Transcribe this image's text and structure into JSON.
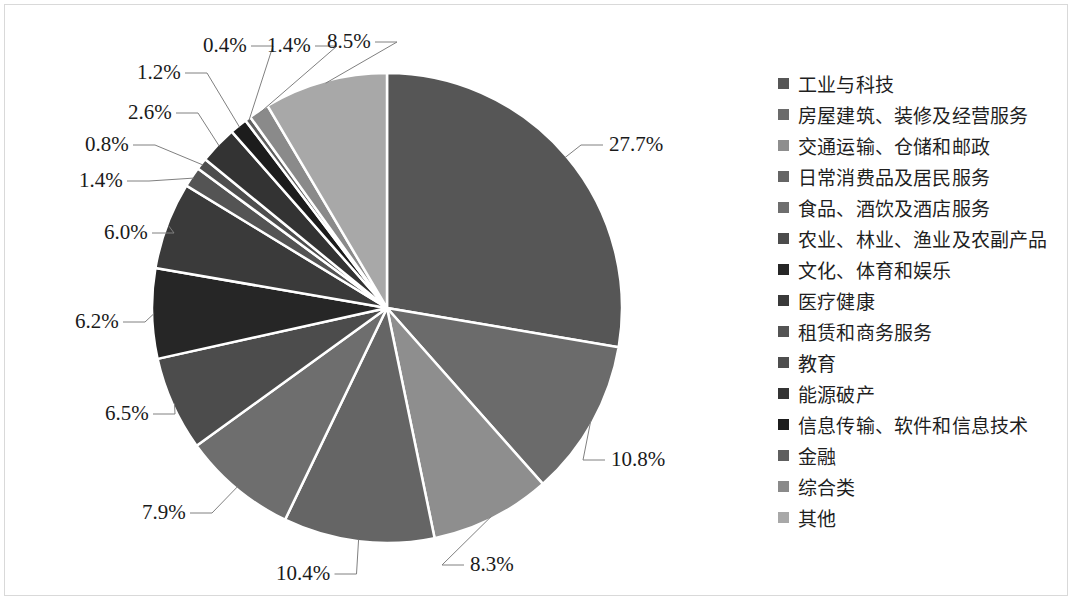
{
  "chart_data": {
    "type": "pie",
    "title": "",
    "legend_position": "right",
    "categories": [
      "工业与科技",
      "房屋建筑、装修及经营服务",
      "交通运输、仓储和邮政",
      "日常消费品及居民服务",
      "食品、酒饮及酒店服务",
      "农业、林业、渔业及农副产品",
      "文化、体育和娱乐",
      "医疗健康",
      "租赁和商务服务",
      "教育",
      "能源破产",
      "信息传输、软件和信息技术",
      "金融",
      "综合类",
      "其他"
    ],
    "values": [
      27.7,
      10.8,
      8.3,
      10.4,
      7.9,
      6.5,
      6.2,
      6.0,
      1.4,
      0.8,
      2.6,
      1.2,
      0.4,
      1.4,
      8.5
    ],
    "value_labels": [
      "27.7%",
      "10.8%",
      "8.3%",
      "10.4%",
      "7.9%",
      "6.5%",
      "6.2%",
      "6.0%",
      "1.4%",
      "0.8%",
      "2.6%",
      "1.2%",
      "0.4%",
      "1.4%",
      "8.5%"
    ],
    "unit": "%",
    "colors": [
      "#565656",
      "#6b6b6b",
      "#8e8e8e",
      "#656565",
      "#6e6e6e",
      "#4c4c4c",
      "#262626",
      "#3a3a3a",
      "#545454",
      "#4e4e4e",
      "#333333",
      "#1c1c1c",
      "#5f5f5f",
      "#8a8a8a",
      "#a8a8a8"
    ],
    "slice_border_color": "#ffffff",
    "leader_line_color": "#808080"
  },
  "legend": {
    "items": [
      {
        "label": "工业与科技",
        "color": "#565656"
      },
      {
        "label": "房屋建筑、装修及经营服务",
        "color": "#6b6b6b"
      },
      {
        "label": "交通运输、仓储和邮政",
        "color": "#8e8e8e"
      },
      {
        "label": "日常消费品及居民服务",
        "color": "#656565"
      },
      {
        "label": "食品、酒饮及酒店服务",
        "color": "#6e6e6e"
      },
      {
        "label": "农业、林业、渔业及农副产品",
        "color": "#4c4c4c"
      },
      {
        "label": "文化、体育和娱乐",
        "color": "#262626"
      },
      {
        "label": "医疗健康",
        "color": "#3a3a3a"
      },
      {
        "label": "租赁和商务服务",
        "color": "#545454"
      },
      {
        "label": "教育",
        "color": "#4e4e4e"
      },
      {
        "label": "能源破产",
        "color": "#333333"
      },
      {
        "label": "信息传输、软件和信息技术",
        "color": "#1c1c1c"
      },
      {
        "label": "金融",
        "color": "#5f5f5f"
      },
      {
        "label": "综合类",
        "color": "#8a8a8a"
      },
      {
        "label": "其他",
        "color": "#a8a8a8"
      }
    ]
  },
  "pie_labels": [
    {
      "text": "27.7%",
      "x": 609,
      "y": 134
    },
    {
      "text": "10.8%",
      "x": 611,
      "y": 449
    },
    {
      "text": "8.3%",
      "x": 470,
      "y": 554
    },
    {
      "text": "10.4%",
      "x": 276,
      "y": 563
    },
    {
      "text": "7.9%",
      "x": 142,
      "y": 502
    },
    {
      "text": "6.5%",
      "x": 105,
      "y": 403
    },
    {
      "text": "6.2%",
      "x": 75,
      "y": 311
    },
    {
      "text": "6.0%",
      "x": 104,
      "y": 222
    },
    {
      "text": "1.4%",
      "x": 79,
      "y": 170
    },
    {
      "text": "0.8%",
      "x": 85,
      "y": 134
    },
    {
      "text": "2.6%",
      "x": 128,
      "y": 102
    },
    {
      "text": "1.2%",
      "x": 137,
      "y": 62
    },
    {
      "text": "0.4%",
      "x": 203,
      "y": 35
    },
    {
      "text": "1.4%",
      "x": 267,
      "y": 35
    },
    {
      "text": "8.5%",
      "x": 327,
      "y": 31
    }
  ]
}
